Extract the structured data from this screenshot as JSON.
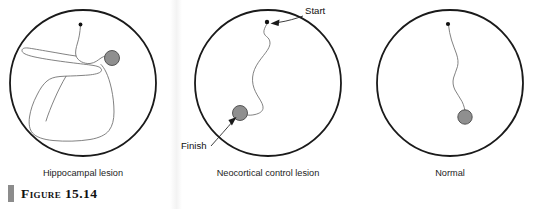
{
  "figure": {
    "caption_number": "Figure 15.14",
    "caption_bar_color": "#8c8c8c"
  },
  "colors": {
    "arena_stroke": "#1a1a1a",
    "path_stroke": "#6b6b6b",
    "platform_fill": "#8f8f8f",
    "platform_stroke": "#4a4a4a",
    "start_dot": "#111111",
    "label_text": "#1c1c1c"
  },
  "panels": [
    {
      "id": "hippocampal-lesion",
      "label": "Hippocampal lesion",
      "arena": {
        "cx": 83,
        "cy": 83,
        "r": 73
      },
      "start_dot": {
        "x": 80.5,
        "y": 24.5,
        "r": 1.9
      },
      "platform": {
        "cx": 112,
        "cy": 58,
        "r": 7.5
      },
      "path": "M80.5,25.5 C80,33 79,38 77.5,43 C76,48 75,52 76,56 C78,61 84,64 90,63.5 C95,63 98,60 101,58 C104,56 107,55.5 109,56 M76,56 C68,55 58,53 49,51.5 C40,50 32,48.5 28,48 C24,47.6 22,48.6 22,50.6 C22,53 26,55 34,56.8 C44,59 58,61 70,62.5 C80,63.8 88,64.6 93,65.4 C97,66 100,67 101,68.5 C102,70 101.5,71.6 99.5,72.6 C96,74.4 90,75 83,75.4 C74,76 66,76 60,76.5 C54,77 50,78.5 47,81 C43,84.3 40,89 37,95 C33,102.5 30.5,110 29.5,117 C28.5,124 29.5,129.5 32.5,133 C36,137 43,139.5 53,140.5 C65,141.7 79,141.3 90,139.5 C99,138 105.5,135 109,130.5 C112.5,126 114,119.5 114,112 C114,104 113,96 111.5,89 C110,82 108,76 106,72 C104.3,68.5 102.5,66 101,64.5 M66,76.3 C62,83 58,91 54.5,99 C51,107 48,114.5 46,121"
    },
    {
      "id": "neocortical-control-lesion",
      "label": "Neocortical control lesion",
      "arena": {
        "cx": 268,
        "cy": 83,
        "r": 73
      },
      "start_dot": {
        "x": 267,
        "y": 22,
        "r": 2.2
      },
      "platform": {
        "cx": 240,
        "cy": 113,
        "r": 7.5
      },
      "path": "M267.5,23 C266,25.5 264.5,28 264,30.5 C263.5,33 264.5,35 266.5,36.5 C268.5,38 270,40 270,43 C270,47 267,51 263.5,55.5 C260,60 256.5,64.5 254.5,69.5 C252.5,74.5 252,79.5 253,84.5 C254,89.5 256.5,94 259,98 C261.5,102 263.5,105.5 263,108.5 C262.5,111.5 259.5,113.5 255,114.5 C252,115.2 249.5,115.4 247.5,115"
    },
    {
      "id": "normal",
      "label": "Normal",
      "arena": {
        "cx": 450,
        "cy": 83,
        "r": 73
      },
      "start_dot": {
        "x": 448,
        "y": 24,
        "r": 2.1
      },
      "platform": {
        "cx": 465,
        "cy": 117,
        "r": 7.2
      },
      "path": "M448.5,25 C449,30 450,35 451.5,40 C453,45 455,49.5 456.5,54 C458,58.5 458.5,62.5 457.5,66.5 C456.5,70.5 454.5,74 453.5,78 C452.5,82 453,86 455,90 C457,94 460,97.5 462,101.5 C464,105.5 465,109.5 465,113"
    }
  ],
  "callouts": [
    {
      "id": "start",
      "text": "Start",
      "text_x": 305,
      "text_y": 14,
      "line": "M303,16 C296,18.5 288,21 278,22.5",
      "arrow_tip": {
        "x": 270.5,
        "y": 23.5
      },
      "arrow_angle": 192
    },
    {
      "id": "finish",
      "text": "Finish",
      "text_x": 181,
      "text_y": 149,
      "line": "M211,146 C219,137 227,128 233.5,120.5",
      "arrow_tip": {
        "x": 236.5,
        "y": 117
      },
      "arrow_angle": -50
    }
  ]
}
